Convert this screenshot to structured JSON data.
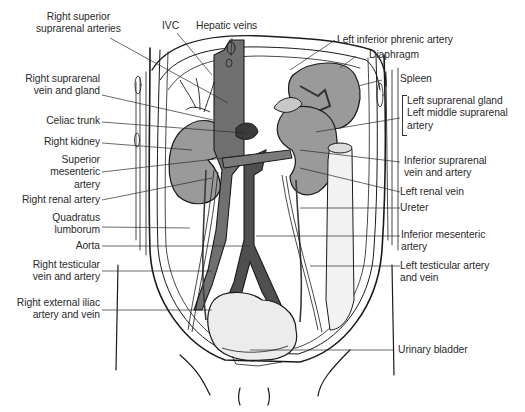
{
  "figure": {
    "colors": {
      "background": "#ffffff",
      "ink": "#1a1a1a",
      "organ_fill": "#9a9a9a",
      "vessel_fill": "#6f6f6f",
      "dark_vessel": "#4a4a4a",
      "bladder_fill": "#e9e9e9",
      "label_text": "#2a2a2a"
    }
  },
  "labels": {
    "top": [
      {
        "id": "right-superior-suprarenal-arteries",
        "lines": [
          "Right superior",
          "suprarenal arteries"
        ]
      },
      {
        "id": "ivc",
        "lines": [
          "IVC"
        ]
      },
      {
        "id": "hepatic-veins",
        "lines": [
          "Hepatic veins"
        ]
      }
    ],
    "left": [
      {
        "id": "right-suprarenal-vein-and-gland",
        "lines": [
          "Right suprarenal",
          "vein and gland"
        ]
      },
      {
        "id": "celiac-trunk",
        "lines": [
          "Celiac trunk"
        ]
      },
      {
        "id": "right-kidney",
        "lines": [
          "Right kidney"
        ]
      },
      {
        "id": "superior-mesenteric-artery",
        "lines": [
          "Superior",
          "mesenteric",
          "artery"
        ]
      },
      {
        "id": "right-renal-artery",
        "lines": [
          "Right renal artery"
        ]
      },
      {
        "id": "quadratus-lumborum",
        "lines": [
          "Quadratus",
          "lumborum"
        ]
      },
      {
        "id": "aorta",
        "lines": [
          "Aorta"
        ]
      },
      {
        "id": "right-testicular-vein-and-artery",
        "lines": [
          "Right testicular",
          "vein and artery"
        ]
      },
      {
        "id": "right-external-iliac-artery-and-vein",
        "lines": [
          "Right external iliac",
          "artery and vein"
        ]
      }
    ],
    "right": [
      {
        "id": "left-inferior-phrenic-artery",
        "lines": [
          "Left inferior phrenic artery"
        ]
      },
      {
        "id": "diaphragm",
        "lines": [
          "Diaphragm"
        ]
      },
      {
        "id": "spleen",
        "lines": [
          "Spleen"
        ]
      },
      {
        "id": "left-suprarenal-gland-group",
        "lines": [
          "Left suprarenal gland",
          "Left middle suprarenal",
          "artery"
        ]
      },
      {
        "id": "inferior-suprarenal-vein-and-artery",
        "lines": [
          "Inferior suprarenal",
          "vein and artery"
        ]
      },
      {
        "id": "left-renal-vein",
        "lines": [
          "Left renal vein"
        ]
      },
      {
        "id": "ureter",
        "lines": [
          "Ureter"
        ]
      },
      {
        "id": "inferior-mesenteric-artery",
        "lines": [
          "Inferior mesenteric",
          "artery"
        ]
      },
      {
        "id": "left-testicular-artery-and-vein",
        "lines": [
          "Left testicular artery",
          "and vein"
        ]
      },
      {
        "id": "urinary-bladder",
        "lines": [
          "Urinary bladder"
        ]
      }
    ]
  }
}
